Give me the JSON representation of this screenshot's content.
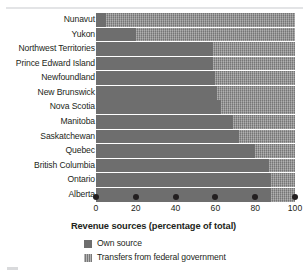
{
  "chart_data": {
    "type": "bar",
    "orientation": "horizontal",
    "stacked": true,
    "title": "",
    "xlabel": "Revenue sources (percentage of total)",
    "ylabel": "",
    "xlim": [
      0,
      100
    ],
    "xticks": [
      "0",
      "20",
      "40",
      "60",
      "80",
      "100"
    ],
    "grid": false,
    "legend_position": "bottom",
    "categories": [
      "Nunavut",
      "Yukon",
      "Northwest Territories",
      "Prince Edward Island",
      "Newfoundland",
      "New Brunswick",
      "Nova Scotia",
      "Manitoba",
      "Saskatchewan",
      "Quebec",
      "British Columbia",
      "Ontario",
      "Alberta"
    ],
    "series": [
      {
        "name": "Own source",
        "color": "#6e6e6e",
        "values": [
          5,
          20,
          59,
          59,
          60,
          61,
          63,
          69,
          72,
          80,
          87,
          88,
          88
        ]
      },
      {
        "name": "Transfers from federal government",
        "color": "#8d8d8d",
        "values": [
          95,
          80,
          41,
          41,
          40,
          39,
          37,
          31,
          28,
          20,
          13,
          12,
          12
        ]
      }
    ]
  },
  "axis": {
    "title": "Revenue sources (percentage of total)",
    "ticks": [
      {
        "label": "0",
        "value": 0
      },
      {
        "label": "20",
        "value": 20
      },
      {
        "label": "40",
        "value": 40
      },
      {
        "label": "60",
        "value": 60
      },
      {
        "label": "80",
        "value": 80
      },
      {
        "label": "100",
        "value": 100
      }
    ]
  },
  "legend": {
    "items": [
      {
        "label": "Own source",
        "color": "#6e6e6e"
      },
      {
        "label": "Transfers from federal government",
        "color": "#8d8d8d"
      }
    ]
  }
}
